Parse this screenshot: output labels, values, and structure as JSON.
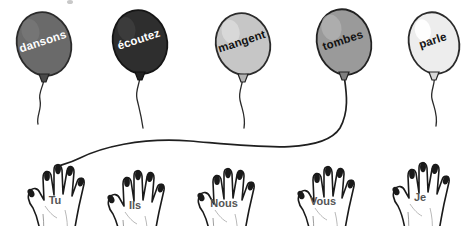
{
  "scene": {
    "width": 471,
    "height": 226,
    "background": "#ffffff",
    "title": "French verb conjugation balloons and hands"
  },
  "balloons": [
    {
      "id": "balloon-dansons",
      "label": "dansons",
      "fill": "#6a6a6a",
      "stroke": "#2b2b2b",
      "text_color": "#ffffff",
      "text_tone": "light",
      "cx": 44,
      "cy": 44,
      "rx": 27,
      "ry": 32,
      "rotate": -14,
      "label_x": 44,
      "label_y": 45,
      "string": "M 44,78 C 44,86 38,92 40,100 C 42,110 36,116 38,124"
    },
    {
      "id": "balloon-ecoutez",
      "label": "écoutez",
      "fill": "#2e2e2e",
      "stroke": "#151515",
      "text_color": "#ffffff",
      "text_tone": "light",
      "cx": 140,
      "cy": 42,
      "rx": 27,
      "ry": 32,
      "rotate": -14,
      "label_x": 140,
      "label_y": 43,
      "string": "M 140,76 C 140,84 135,90 137,99 C 139,108 141,114 143,128"
    },
    {
      "id": "balloon-mangent",
      "label": "mangent",
      "fill": "#c6c6c6",
      "stroke": "#2b2b2b",
      "text_color": "#121212",
      "text_tone": "dark",
      "cx": 243,
      "cy": 44,
      "rx": 27,
      "ry": 31,
      "rotate": -14,
      "label_x": 243,
      "label_y": 45,
      "string": "M 243,76 C 243,85 238,91 240,100 C 242,110 246,116 244,128"
    },
    {
      "id": "balloon-tombes",
      "label": "tombes",
      "fill": "#9a9a9a",
      "stroke": "#222222",
      "text_color": "#121212",
      "text_tone": "dark",
      "cx": 344,
      "cy": 42,
      "rx": 27,
      "ry": 33,
      "rotate": -13,
      "label_x": 344,
      "label_y": 44,
      "string": ""
    },
    {
      "id": "balloon-parle",
      "label": "parle",
      "fill": "#ededed",
      "stroke": "#2b2b2b",
      "text_color": "#121212",
      "text_tone": "dark",
      "cx": 434,
      "cy": 43,
      "rx": 25,
      "ry": 31,
      "rotate": -13,
      "label_x": 434,
      "label_y": 44,
      "string": "M 434,75 C 436,84 430,90 432,99 C 434,108 438,114 436,126"
    }
  ],
  "connector": {
    "id": "string-tombes-to-tu",
    "from": "balloon-tombes",
    "to": "hand-tu",
    "path": "M 344,75 C 346,90 350,110 340,128 C 322,156 250,146 190,141 C 140,137 100,148 80,158 C 68,164 60,165 56,167"
  },
  "hands": [
    {
      "id": "hand-tu",
      "label": "Tu",
      "x": 55,
      "y": 162,
      "label_x": 55,
      "label_y": 204,
      "flip": false
    },
    {
      "id": "hand-ils",
      "label": "Ils",
      "x": 135,
      "y": 168,
      "label_x": 135,
      "label_y": 209,
      "flip": false
    },
    {
      "id": "hand-nous",
      "label": "Nous",
      "x": 225,
      "y": 166,
      "label_x": 224,
      "label_y": 207,
      "flip": false
    },
    {
      "id": "hand-vous",
      "label": "Vous",
      "x": 325,
      "y": 163,
      "label_x": 323,
      "label_y": 205,
      "flip": false
    },
    {
      "id": "hand-je",
      "label": "Je",
      "x": 420,
      "y": 160,
      "label_x": 420,
      "label_y": 201,
      "flip": false
    }
  ],
  "marks": [
    {
      "id": "speck-top",
      "cx": 70,
      "cy": 2,
      "rx": 3,
      "ry": 2
    }
  ]
}
